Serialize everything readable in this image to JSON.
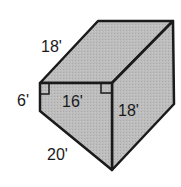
{
  "figure": {
    "type": "triangular-prism",
    "fill_color": "#b9b9b9",
    "stroke_color": "#1a1a1a",
    "labels": {
      "top_edge": "18'",
      "left_height": "6'",
      "front_top": "16'",
      "front_right": "18'",
      "bottom_edge": "20'"
    }
  }
}
